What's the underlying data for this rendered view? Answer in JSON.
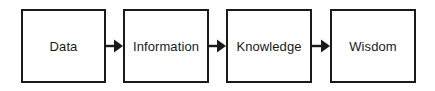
{
  "diagram": {
    "type": "flow-diagram",
    "orientation": "left-to-right",
    "background_color": "#ffffff",
    "stroke_color": "#1a1a1a",
    "text_color": "#1a1a1a",
    "nodes": [
      {
        "id": "data",
        "label": "Data",
        "x": 21,
        "y": 9,
        "width": 85,
        "height": 74
      },
      {
        "id": "information",
        "label": "Information",
        "x": 123,
        "y": 9,
        "width": 86,
        "height": 74
      },
      {
        "id": "knowledge",
        "label": "Knowledge",
        "x": 226,
        "y": 9,
        "width": 86,
        "height": 74
      },
      {
        "id": "wisdom",
        "label": "Wisdom",
        "x": 330,
        "y": 9,
        "width": 86,
        "height": 74
      }
    ],
    "connectors": [
      {
        "id": "data-to-information",
        "from": "data",
        "to": "information",
        "shape": "arrow-right",
        "x": 106,
        "y": 37,
        "width": 17
      },
      {
        "id": "information-to-knowledge",
        "from": "information",
        "to": "knowledge",
        "shape": "arrow-right",
        "x": 209,
        "y": 37,
        "width": 17
      },
      {
        "id": "knowledge-to-wisdom",
        "from": "knowledge",
        "to": "wisdom",
        "shape": "arrow-right",
        "x": 312,
        "y": 37,
        "width": 18
      }
    ]
  }
}
